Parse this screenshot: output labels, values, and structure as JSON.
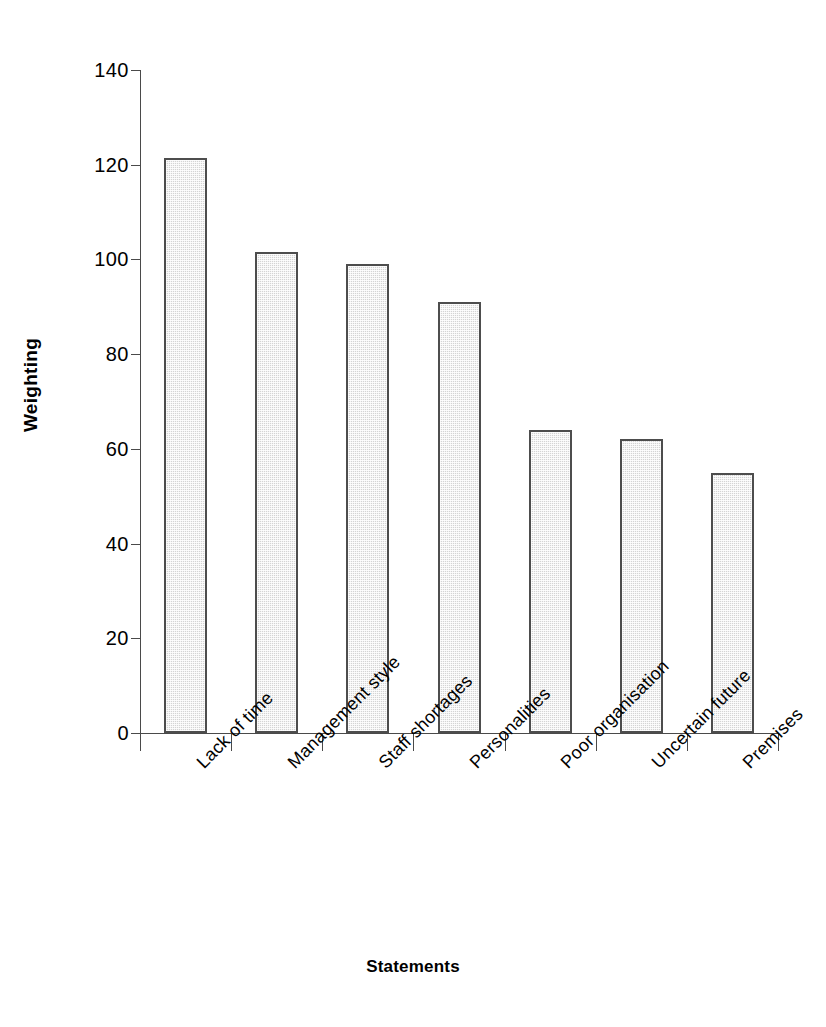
{
  "chart_data": {
    "type": "bar",
    "title": "",
    "xlabel": "Statements",
    "ylabel": "Weighting",
    "categories": [
      "Lack of time",
      "Management style",
      "Staff shortages",
      "Personalities",
      "Poor organisation",
      "Uncertain future",
      "Premises"
    ],
    "values": [
      121.5,
      101.5,
      99,
      91,
      64,
      62,
      55
    ],
    "ylim": [
      0,
      140
    ],
    "ytick_values": [
      0,
      20,
      40,
      60,
      80,
      100,
      120,
      140
    ],
    "ytick_labels": [
      "0",
      "20",
      "40",
      "60",
      "80",
      "100",
      "120",
      "140"
    ],
    "grid": false,
    "legend": null,
    "bar_fill_color": "#d4d4d4",
    "bar_border_color": "#4d4d4d",
    "axis_color": "#4a4a4a",
    "background_color": "#ffffff"
  }
}
